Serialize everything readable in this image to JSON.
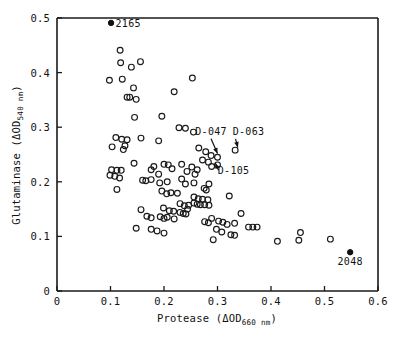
{
  "chart_data": {
    "type": "scatter",
    "title": "",
    "xlabel": "Protease (ΔOD660 nm)",
    "ylabel": "Glutaminase (ΔOD540 nm)",
    "xlabel_parts": {
      "name": "Protease (ΔOD",
      "sub": "660 nm",
      "close": ")"
    },
    "ylabel_parts": {
      "name": "Glutaminase (ΔOD",
      "sub": "540 nm",
      "close": ")"
    },
    "xlim": [
      0,
      0.6
    ],
    "ylim": [
      0,
      0.5
    ],
    "xticks": [
      0,
      0.1,
      0.2,
      0.3,
      0.4,
      0.5,
      0.6
    ],
    "xticklabels": [
      "0",
      "0.1",
      "0.2",
      "0.3",
      "0.4",
      "0.5",
      "0.6"
    ],
    "yticks": [
      0,
      0.1,
      0.2,
      0.3,
      0.4,
      0.5
    ],
    "yticklabels": [
      "0",
      "0.1",
      "0.2",
      "0.3",
      "0.4",
      "0.5"
    ],
    "grid": false,
    "legend": "none",
    "marker_open": "open-circle",
    "marker_filled": "filled-circle",
    "series": [
      {
        "name": "strains-open",
        "marker": "open-circle",
        "points": [
          [
            0.118,
            0.441
          ],
          [
            0.119,
            0.418
          ],
          [
            0.139,
            0.41
          ],
          [
            0.156,
            0.42
          ],
          [
            0.098,
            0.386
          ],
          [
            0.122,
            0.388
          ],
          [
            0.143,
            0.372
          ],
          [
            0.131,
            0.355
          ],
          [
            0.136,
            0.355
          ],
          [
            0.148,
            0.351
          ],
          [
            0.253,
            0.39
          ],
          [
            0.219,
            0.365
          ],
          [
            0.145,
            0.318
          ],
          [
            0.196,
            0.32
          ],
          [
            0.228,
            0.299
          ],
          [
            0.24,
            0.298
          ],
          [
            0.255,
            0.291
          ],
          [
            0.11,
            0.281
          ],
          [
            0.121,
            0.278
          ],
          [
            0.131,
            0.277
          ],
          [
            0.157,
            0.28
          ],
          [
            0.103,
            0.264
          ],
          [
            0.127,
            0.266
          ],
          [
            0.124,
            0.259
          ],
          [
            0.19,
            0.275
          ],
          [
            0.333,
            0.258
          ],
          [
            0.265,
            0.262
          ],
          [
            0.278,
            0.255
          ],
          [
            0.288,
            0.248
          ],
          [
            0.3,
            0.245
          ],
          [
            0.272,
            0.24
          ],
          [
            0.283,
            0.236
          ],
          [
            0.3,
            0.231
          ],
          [
            0.289,
            0.228
          ],
          [
            0.144,
            0.234
          ],
          [
            0.181,
            0.228
          ],
          [
            0.2,
            0.232
          ],
          [
            0.208,
            0.231
          ],
          [
            0.233,
            0.232
          ],
          [
            0.215,
            0.224
          ],
          [
            0.252,
            0.227
          ],
          [
            0.262,
            0.222
          ],
          [
            0.102,
            0.222
          ],
          [
            0.112,
            0.221
          ],
          [
            0.12,
            0.221
          ],
          [
            0.099,
            0.212
          ],
          [
            0.108,
            0.21
          ],
          [
            0.117,
            0.207
          ],
          [
            0.176,
            0.222
          ],
          [
            0.19,
            0.214
          ],
          [
            0.243,
            0.219
          ],
          [
            0.258,
            0.214
          ],
          [
            0.16,
            0.203
          ],
          [
            0.166,
            0.202
          ],
          [
            0.176,
            0.204
          ],
          [
            0.192,
            0.198
          ],
          [
            0.206,
            0.2
          ],
          [
            0.233,
            0.205
          ],
          [
            0.24,
            0.196
          ],
          [
            0.256,
            0.198
          ],
          [
            0.284,
            0.196
          ],
          [
            0.275,
            0.188
          ],
          [
            0.279,
            0.185
          ],
          [
            0.112,
            0.186
          ],
          [
            0.196,
            0.183
          ],
          [
            0.205,
            0.178
          ],
          [
            0.213,
            0.18
          ],
          [
            0.225,
            0.179
          ],
          [
            0.322,
            0.174
          ],
          [
            0.256,
            0.172
          ],
          [
            0.264,
            0.169
          ],
          [
            0.272,
            0.168
          ],
          [
            0.282,
            0.167
          ],
          [
            0.256,
            0.161
          ],
          [
            0.262,
            0.159
          ],
          [
            0.268,
            0.158
          ],
          [
            0.276,
            0.158
          ],
          [
            0.284,
            0.157
          ],
          [
            0.246,
            0.157
          ],
          [
            0.238,
            0.156
          ],
          [
            0.23,
            0.16
          ],
          [
            0.244,
            0.15
          ],
          [
            0.157,
            0.149
          ],
          [
            0.199,
            0.152
          ],
          [
            0.21,
            0.147
          ],
          [
            0.218,
            0.146
          ],
          [
            0.23,
            0.144
          ],
          [
            0.236,
            0.142
          ],
          [
            0.241,
            0.141
          ],
          [
            0.344,
            0.142
          ],
          [
            0.168,
            0.137
          ],
          [
            0.176,
            0.134
          ],
          [
            0.193,
            0.136
          ],
          [
            0.2,
            0.133
          ],
          [
            0.206,
            0.135
          ],
          [
            0.219,
            0.132
          ],
          [
            0.289,
            0.133
          ],
          [
            0.276,
            0.127
          ],
          [
            0.283,
            0.125
          ],
          [
            0.302,
            0.128
          ],
          [
            0.31,
            0.126
          ],
          [
            0.318,
            0.122
          ],
          [
            0.332,
            0.124
          ],
          [
            0.358,
            0.117
          ],
          [
            0.366,
            0.117
          ],
          [
            0.374,
            0.117
          ],
          [
            0.148,
            0.115
          ],
          [
            0.176,
            0.113
          ],
          [
            0.187,
            0.11
          ],
          [
            0.2,
            0.106
          ],
          [
            0.298,
            0.113
          ],
          [
            0.308,
            0.108
          ],
          [
            0.325,
            0.103
          ],
          [
            0.332,
            0.102
          ],
          [
            0.455,
            0.107
          ],
          [
            0.292,
            0.094
          ],
          [
            0.412,
            0.091
          ],
          [
            0.452,
            0.093
          ],
          [
            0.511,
            0.095
          ]
        ]
      },
      {
        "name": "labeled-strains-filled",
        "marker": "filled-circle",
        "points": [
          {
            "x": 0.101,
            "y": 0.491,
            "label": "2165",
            "label_pos": "right"
          },
          {
            "x": 0.548,
            "y": 0.071,
            "label": "2048",
            "label_pos": "below"
          }
        ]
      }
    ],
    "annotations": [
      {
        "text": "D-047",
        "text_x": 0.288,
        "text_y": 0.286,
        "target_x": 0.3,
        "target_y": 0.252,
        "arrow": "down"
      },
      {
        "text": "D-063",
        "text_x": 0.358,
        "text_y": 0.286,
        "target_x": 0.338,
        "target_y": 0.263,
        "arrow": "down-left"
      },
      {
        "text": "D-105",
        "text_x": 0.33,
        "text_y": 0.214,
        "target_x": 0.296,
        "target_y": 0.234,
        "arrow": "up-left"
      }
    ]
  }
}
